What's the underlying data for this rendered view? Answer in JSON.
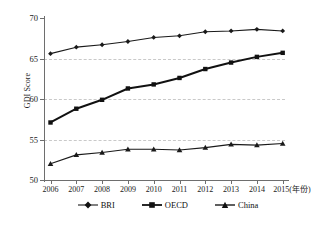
{
  "chart_data": {
    "type": "line",
    "title": "",
    "subtitle": "",
    "xlabel": "年份",
    "xlabel_full": "2015(年份)",
    "ylabel": "GDI Score",
    "x": [
      2006,
      2007,
      2008,
      2009,
      2010,
      2011,
      2012,
      2013,
      2014,
      2015
    ],
    "categories": [
      "2006",
      "2007",
      "2008",
      "2009",
      "2010",
      "2011",
      "2012",
      "2013",
      "2014",
      "2015(年份)"
    ],
    "xlim": [
      2006,
      2015
    ],
    "ylim": [
      50,
      70
    ],
    "yticks": [
      50,
      55,
      60,
      65,
      70
    ],
    "ytick_labels": [
      "50",
      "55",
      "60",
      "65",
      "70"
    ],
    "gridlines": {
      "horizontal": true,
      "vertical": false,
      "at": [
        55,
        60,
        65
      ],
      "style": "dashed",
      "color": "#c9c9c9"
    },
    "legend_position": "bottom",
    "series": [
      {
        "name": "BRI",
        "marker": "diamond",
        "color": "#1a1a1a",
        "line_width": 1.1,
        "values": [
          65.6,
          66.4,
          66.7,
          67.1,
          67.6,
          67.8,
          68.3,
          68.4,
          68.6,
          68.4
        ]
      },
      {
        "name": "OECD",
        "marker": "square",
        "color": "#111111",
        "line_width": 2.0,
        "values": [
          57.1,
          58.8,
          59.9,
          61.3,
          61.8,
          62.6,
          63.7,
          64.5,
          65.2,
          65.7
        ]
      },
      {
        "name": "China",
        "marker": "triangle",
        "color": "#1a1a1a",
        "line_width": 1.1,
        "values": [
          52.0,
          53.1,
          53.4,
          53.8,
          53.8,
          53.7,
          54.0,
          54.4,
          54.3,
          54.5
        ]
      }
    ]
  },
  "axes": {
    "y_title": "GDI Score",
    "y_tick_labels": [
      "70",
      "65",
      "60",
      "55",
      "50"
    ],
    "x_tick_labels": [
      "2006",
      "2007",
      "2008",
      "2009",
      "2010",
      "2011",
      "2012",
      "2013",
      "2014",
      "2015(年份)"
    ]
  },
  "legend": {
    "items": [
      {
        "label": "BRI",
        "marker": "diamond"
      },
      {
        "label": "OECD",
        "marker": "square"
      },
      {
        "label": "China",
        "marker": "triangle"
      }
    ]
  },
  "colors": {
    "background": "#ffffff",
    "axis": "#6e6e6e",
    "grid": "#c9c9c9",
    "ink": "#1a1a1a"
  }
}
